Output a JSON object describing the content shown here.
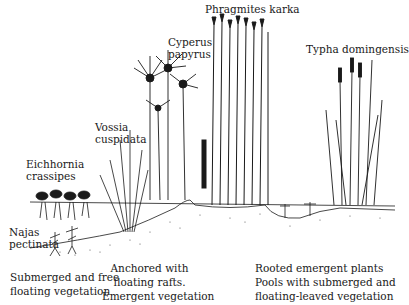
{
  "species_labels": {
    "phragmites": "Phragmites karka",
    "cyperus_line1": "Cyperus",
    "cyperus_line2": "papyrus",
    "typha": "Typha domingensis",
    "vossia_line1": "Vossia",
    "vossia_line2": "cuspidata",
    "eichhornia_line1": "Eichhornia",
    "eichhornia_line2": "crassipes",
    "najas_line1": "Najas",
    "najas_line2": "pectinata"
  },
  "zone_captions": {
    "zone1": [
      "Submerged and free",
      "floating vegetation"
    ],
    "zone2": [
      "Anchored with",
      "floating rafts.",
      "Emergent vegetation"
    ],
    "zone3": [
      "Rooted emergent plants",
      "Pools with submerged and",
      "floating-leaved vegetation"
    ]
  },
  "colors": {
    "ink": "#1a1a1a",
    "background": "#ffffff"
  }
}
